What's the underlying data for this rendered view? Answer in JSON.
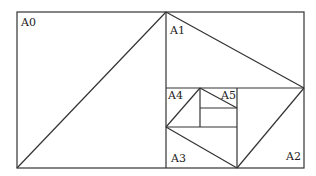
{
  "diagram": {
    "labels": {
      "a0": "A0",
      "a1": "A1",
      "a2": "A2",
      "a3": "A3",
      "a4": "A4",
      "a5": "A5"
    },
    "line_color": "#333333"
  }
}
